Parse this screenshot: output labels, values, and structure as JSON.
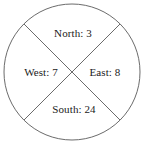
{
  "figure": {
    "type": "circle-divided-into-four-sectors",
    "background_color": "#ffffff",
    "stroke_color": "#6b6b6b",
    "text_color": "#1a1a1a",
    "circle": {
      "center_x": 72,
      "center_y": 72,
      "radius": 68
    },
    "dividers": [
      {
        "name": "diagonal-nw-se",
        "x1": 24,
        "y1": 24,
        "x2": 120,
        "y2": 120
      },
      {
        "name": "diagonal-ne-sw",
        "x1": 120,
        "y1": 24,
        "x2": 24,
        "y2": 120
      }
    ],
    "sectors": [
      {
        "key": "north",
        "label": "North: 3",
        "direction": "North",
        "value": 3
      },
      {
        "key": "west",
        "label": "West: 7",
        "direction": "West",
        "value": 7
      },
      {
        "key": "east",
        "label": "East: 8",
        "direction": "East",
        "value": 8
      },
      {
        "key": "south",
        "label": "South: 24",
        "direction": "South",
        "value": 24
      }
    ]
  },
  "chart_data": {
    "type": "pie",
    "title": "",
    "subtitle": "",
    "xlabel": "",
    "ylabel": "",
    "legend_position": "none",
    "grid": false,
    "note": "Circle drawn with two diagonals producing four equal quadrants; the labels state counts per direction rather than proportional slice areas.",
    "categories": [
      "North",
      "East",
      "South",
      "West"
    ],
    "values": [
      3,
      8,
      24,
      7
    ],
    "data_labels": [
      "North: 3",
      "East: 8",
      "South: 24",
      "West: 7"
    ],
    "slice_angles_deg": [
      90,
      90,
      90,
      90
    ],
    "total": 42
  }
}
